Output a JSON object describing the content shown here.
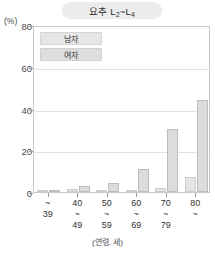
{
  "chart_data": {
    "type": "bar",
    "title_main": "요추 L",
    "title_sub1": "2",
    "title_mid": "~L",
    "title_sub2": "4",
    "xlabel": "(연령, 세)",
    "ylabel": "(%)",
    "ylim": [
      0,
      80
    ],
    "yticks": [
      0,
      20,
      40,
      60,
      80
    ],
    "grid": true,
    "legend_position": "top-left",
    "categories": [
      "~39",
      "40~49",
      "50~59",
      "60~69",
      "70~79",
      "80~"
    ],
    "category_lines": [
      {
        "l1": "~",
        "l2": "39",
        "l3": ""
      },
      {
        "l1": "40",
        "l2": "~",
        "l3": "49"
      },
      {
        "l1": "50",
        "l2": "~",
        "l3": "59"
      },
      {
        "l1": "60",
        "l2": "~",
        "l3": "69"
      },
      {
        "l1": "70",
        "l2": "~",
        "l3": "79"
      },
      {
        "l1": "80",
        "l2": "~",
        "l3": ""
      }
    ],
    "series": [
      {
        "name": "남자",
        "values": [
          0.3,
          1.5,
          1.2,
          1.0,
          2.0,
          7.0
        ]
      },
      {
        "name": "여자",
        "values": [
          0.4,
          3.0,
          4.5,
          11.0,
          30.0,
          44.0
        ]
      }
    ]
  },
  "legend": {
    "items": [
      {
        "label": "남자"
      },
      {
        "label": "여자"
      }
    ]
  },
  "colors": {
    "male_fill": "#e4e4e4",
    "female_fill": "#dcdcdc",
    "grid": "#e2e2e2",
    "frame": "#c9c9c9",
    "title_pill": "#ececec"
  }
}
